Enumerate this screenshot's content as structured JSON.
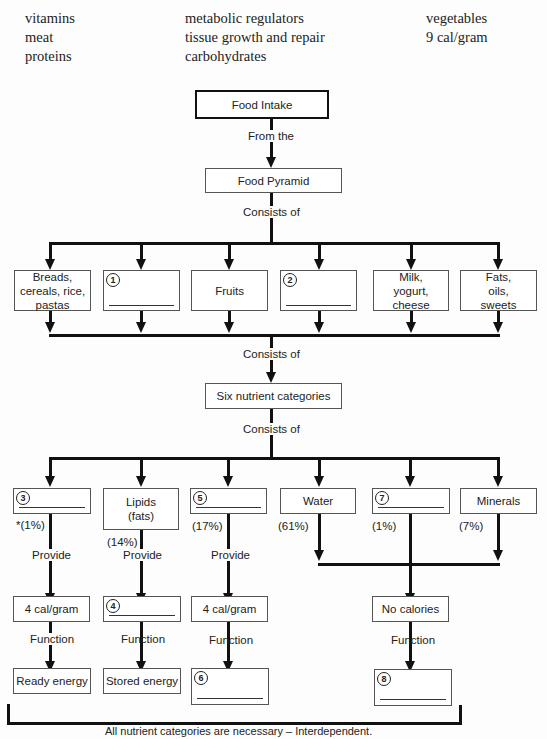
{
  "word_bank": {
    "col1": [
      "vitamins",
      "meat",
      "proteins"
    ],
    "col2": [
      "metabolic regulators",
      "tissue growth and repair",
      "carbohydrates"
    ],
    "col3": [
      "vegetables",
      "9 cal/gram"
    ]
  },
  "diagram": {
    "root": "Food Intake",
    "link_from": "From the",
    "pyramid": "Food Pyramid",
    "link_consists1": "Consists of",
    "food_groups": [
      {
        "label": "Breads, cereals, rice, pastas"
      },
      {
        "blank": "1"
      },
      {
        "label": "Fruits"
      },
      {
        "blank": "2"
      },
      {
        "label": "Milk, yogurt, cheese"
      },
      {
        "label": "Fats, oils, sweets"
      }
    ],
    "link_consists2": "Consists of",
    "nutrients_title": "Six nutrient categories",
    "link_consists3": "Consists of",
    "nutrients": [
      {
        "blank": "3",
        "percent": "*(1%)"
      },
      {
        "label": "Lipids (fats)",
        "percent": "(14%)"
      },
      {
        "blank": "5",
        "percent": "(17%)"
      },
      {
        "label": "Water",
        "percent": "(61%)"
      },
      {
        "blank": "7",
        "percent": "(1%)"
      },
      {
        "label": "Minerals",
        "percent": "(7%)"
      }
    ],
    "provide_label": "Provide",
    "function_label": "Function",
    "calories": [
      {
        "label": "4 cal/gram"
      },
      {
        "blank": "4"
      },
      {
        "label": "4 cal/gram"
      },
      {
        "label": "No calories"
      }
    ],
    "functions": [
      {
        "label": "Ready energy"
      },
      {
        "label": "Stored energy"
      },
      {
        "blank": "6"
      },
      {
        "blank": "8"
      }
    ],
    "footer": "All nutrient categories are necessary – Interdependent."
  }
}
